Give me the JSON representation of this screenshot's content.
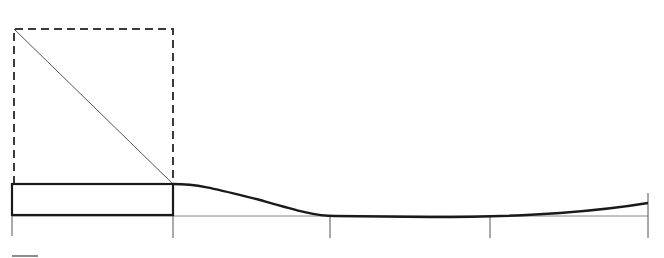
{
  "diagram": {
    "colors": {
      "stroke": "#1a1a1a",
      "thin": "#555555",
      "dashed": "#3a3a3a",
      "background": "#ffffff"
    },
    "baseline_y": 216,
    "tick_positions_x": [
      12,
      173,
      330,
      490,
      648
    ],
    "block": {
      "x": 12,
      "y": 184,
      "width": 161,
      "height": 31
    },
    "dashed_box": {
      "x": 14,
      "y": 29,
      "width": 159,
      "height": 155
    },
    "diagonal": {
      "from": [
        14,
        29
      ],
      "to": [
        173,
        184
      ]
    },
    "curve_end": [
      648,
      203
    ]
  }
}
